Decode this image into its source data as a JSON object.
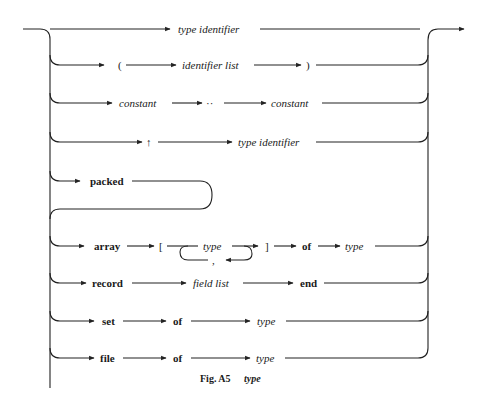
{
  "diagram": {
    "caption": {
      "label": "Fig. A5",
      "title": "type"
    },
    "arrow_color": "#222222",
    "branches": [
      {
        "name": "type-identifier",
        "tokens": [
          {
            "text": "type identifier",
            "style": "italic"
          }
        ]
      },
      {
        "name": "enumerated",
        "tokens": [
          {
            "text": "(",
            "style": "symbol"
          },
          {
            "text": "identifier list",
            "style": "italic"
          },
          {
            "text": ")",
            "style": "symbol"
          }
        ]
      },
      {
        "name": "subrange",
        "tokens": [
          {
            "text": "constant",
            "style": "italic"
          },
          {
            "text": "··",
            "style": "symbol"
          },
          {
            "text": "constant",
            "style": "italic"
          }
        ]
      },
      {
        "name": "pointer",
        "tokens": [
          {
            "text": "↑",
            "style": "symbol"
          },
          {
            "text": "type identifier",
            "style": "italic"
          }
        ]
      },
      {
        "name": "packed",
        "tokens": [
          {
            "text": "packed",
            "style": "bold"
          }
        ]
      },
      {
        "name": "array",
        "tokens": [
          {
            "text": "array",
            "style": "bold"
          },
          {
            "text": "[",
            "style": "symbol"
          },
          {
            "text": "type",
            "style": "italic"
          },
          {
            "text": ",",
            "style": "symbol"
          },
          {
            "text": "]",
            "style": "symbol"
          },
          {
            "text": "of",
            "style": "bold"
          },
          {
            "text": "type",
            "style": "italic"
          }
        ]
      },
      {
        "name": "record",
        "tokens": [
          {
            "text": "record",
            "style": "bold"
          },
          {
            "text": "field list",
            "style": "italic"
          },
          {
            "text": "end",
            "style": "bold"
          }
        ]
      },
      {
        "name": "set",
        "tokens": [
          {
            "text": "set",
            "style": "bold"
          },
          {
            "text": "of",
            "style": "bold"
          },
          {
            "text": "type",
            "style": "italic"
          }
        ]
      },
      {
        "name": "file",
        "tokens": [
          {
            "text": "file",
            "style": "bold"
          },
          {
            "text": "of",
            "style": "bold"
          },
          {
            "text": "type",
            "style": "italic"
          }
        ]
      }
    ]
  }
}
